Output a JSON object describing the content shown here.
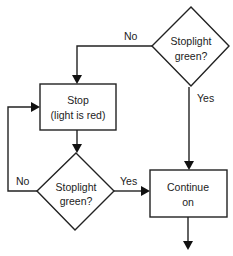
{
  "diagram": {
    "type": "flowchart",
    "nodes": {
      "decision_top": {
        "shape": "diamond",
        "line1": "Stoplight",
        "line2": "green?"
      },
      "stop": {
        "shape": "rectangle",
        "line1": "Stop",
        "line2": "(light is red)"
      },
      "decision_bottom": {
        "shape": "diamond",
        "line1": "Stoplight",
        "line2": "green?"
      },
      "continue": {
        "shape": "rectangle",
        "line1": "Continue",
        "line2": "on"
      }
    },
    "edges": {
      "top_no": {
        "from": "decision_top",
        "to": "stop",
        "label": "No"
      },
      "top_yes": {
        "from": "decision_top",
        "to": "continue",
        "label": "Yes"
      },
      "stop_to_decision": {
        "from": "stop",
        "to": "decision_bottom",
        "label": ""
      },
      "bottom_no": {
        "from": "decision_bottom",
        "to": "stop",
        "label": "No"
      },
      "bottom_yes": {
        "from": "decision_bottom",
        "to": "continue",
        "label": "Yes"
      },
      "continue_out": {
        "from": "continue",
        "to": "",
        "label": ""
      }
    },
    "colors": {
      "line": "#222222",
      "fill": "#ffffff",
      "text": "#222222"
    }
  }
}
